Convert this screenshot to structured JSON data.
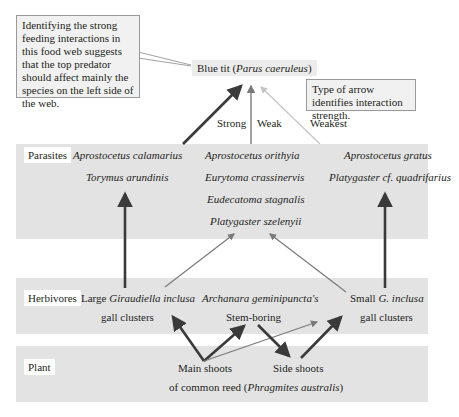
{
  "callouts": {
    "left": "Identifying the strong feeding interactions in this food web suggests that the top predator should affect mainly the species on the left side of the web.",
    "right": "Type of arrow identifies interaction strength."
  },
  "top_predator": {
    "common": "Blue tit (",
    "latin": "Parus caeruleus",
    "close": ")"
  },
  "strength_labels": {
    "strong": "Strong",
    "weak": "Weak",
    "weakest": "Weakest"
  },
  "levels": {
    "parasites": {
      "label": "Parasites",
      "left": [
        "Aprostocetus calamarius",
        "Torymus arundinis"
      ],
      "middle": [
        "Aprostocetus orithyia",
        "Eurytoma crassinervis",
        "Eudecatoma stagnalis",
        "Platygaster szelenyii"
      ],
      "right": [
        "Aprostocetus gratus",
        "Platygaster cf. quadrifarius"
      ]
    },
    "herbivores": {
      "label": "Herbivores",
      "left": {
        "prefix": "Large ",
        "latin": "Giraudiella inclusa",
        "line2": "gall clusters"
      },
      "middle": {
        "latin": "Archanara geminipuncta's",
        "line2": "Stem-boring"
      },
      "right": {
        "prefix": "Small ",
        "latin": "G. inclusa",
        "line2": "gall clusters"
      }
    },
    "plant": {
      "label": "Plant",
      "main": "Main shoots",
      "side": "Side shoots",
      "line2_prefix": "of common reed (",
      "line2_latin": "Phragmites australis",
      "line2_suffix": ")"
    }
  },
  "colors": {
    "band": "#e3e3e4",
    "strong": "#3a3a3a",
    "weak": "#7a7a7a",
    "weakest": "#c4c4c4"
  }
}
